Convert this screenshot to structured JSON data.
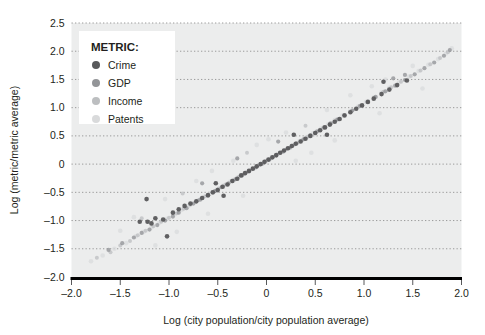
{
  "chart_data": {
    "type": "scatter",
    "title": "",
    "xlabel": "Log (city population/city population average)",
    "ylabel": "Log (metric/metric average)",
    "xlim": [
      -2.0,
      2.0
    ],
    "ylim": [
      -2.0,
      2.5
    ],
    "xticks": [
      "-2.0",
      "-1.5",
      "-1.0",
      "-0.5",
      "0",
      "0.5",
      "1.0",
      "1.5",
      "2.0"
    ],
    "xtick_values": [
      -2.0,
      -1.5,
      -1.0,
      -0.5,
      0,
      0.5,
      1.0,
      1.5,
      2.0
    ],
    "yticks": [
      "2.5",
      "2.0",
      "1.5",
      "1.0",
      "0.5",
      "0",
      "-0.5",
      "-1.0",
      "-1.5",
      "-2.0"
    ],
    "ytick_values": [
      2.5,
      2.0,
      1.5,
      1.0,
      0.5,
      0,
      -0.5,
      -1.0,
      -1.5,
      -2.0
    ],
    "grid": true,
    "grid_style": "dotted-horizontal",
    "legend_position": "top-left",
    "legend_title": "METRIC:",
    "panel_background": "#eceded",
    "series": [
      {
        "name": "Crime",
        "color": "#58595b",
        "marker_size": 4.6,
        "opacity": 0.95,
        "points": [
          [
            -1.3,
            -1.02
          ],
          [
            -1.23,
            -0.62
          ],
          [
            -1.14,
            -0.96
          ],
          [
            -1.06,
            -0.98
          ],
          [
            -1.02,
            -1.28
          ],
          [
            -0.96,
            -0.86
          ],
          [
            -0.9,
            -0.8
          ],
          [
            -0.84,
            -0.74
          ],
          [
            -0.78,
            -0.7
          ],
          [
            -0.72,
            -0.66
          ],
          [
            -0.66,
            -0.6
          ],
          [
            -0.6,
            -0.55
          ],
          [
            -0.55,
            -0.5
          ],
          [
            -0.5,
            -0.46
          ],
          [
            -0.45,
            -0.4
          ],
          [
            -0.4,
            -0.36
          ],
          [
            -0.35,
            -0.3
          ],
          [
            -0.3,
            -0.26
          ],
          [
            -0.26,
            -0.2
          ],
          [
            -0.22,
            -0.16
          ],
          [
            -0.18,
            -0.12
          ],
          [
            -0.14,
            -0.08
          ],
          [
            -0.1,
            -0.04
          ],
          [
            -0.06,
            0.0
          ],
          [
            -0.02,
            0.04
          ],
          [
            0.02,
            0.08
          ],
          [
            0.06,
            0.12
          ],
          [
            0.1,
            0.16
          ],
          [
            0.14,
            0.2
          ],
          [
            0.18,
            0.24
          ],
          [
            0.22,
            0.28
          ],
          [
            0.26,
            0.32
          ],
          [
            0.3,
            0.36
          ],
          [
            0.35,
            0.4
          ],
          [
            0.4,
            0.45
          ],
          [
            0.45,
            0.5
          ],
          [
            0.5,
            0.55
          ],
          [
            0.55,
            0.6
          ],
          [
            0.6,
            0.65
          ],
          [
            0.65,
            0.7
          ],
          [
            0.7,
            0.75
          ],
          [
            0.75,
            0.8
          ],
          [
            0.8,
            0.86
          ],
          [
            0.86,
            0.92
          ],
          [
            0.92,
            0.98
          ],
          [
            0.98,
            1.04
          ],
          [
            1.04,
            1.1
          ],
          [
            1.1,
            1.16
          ],
          [
            1.18,
            1.24
          ],
          [
            1.26,
            1.32
          ],
          [
            1.34,
            1.4
          ],
          [
            1.44,
            1.48
          ],
          [
            1.2,
            1.46
          ],
          [
            0.28,
            0.52
          ],
          [
            -0.44,
            -0.56
          ],
          [
            -0.52,
            -0.34
          ],
          [
            0.62,
            0.52
          ],
          [
            -1.22,
            -1.02
          ],
          [
            -1.18,
            -1.05
          ]
        ]
      },
      {
        "name": "GDP",
        "color": "#939598",
        "marker_size": 4.2,
        "opacity": 0.8,
        "points": [
          [
            -1.62,
            -1.52
          ],
          [
            -1.48,
            -1.4
          ],
          [
            -1.36,
            -1.3
          ],
          [
            -1.28,
            -1.22
          ],
          [
            -1.2,
            -1.16
          ],
          [
            -1.12,
            -1.08
          ],
          [
            -1.04,
            -1.0
          ],
          [
            -0.96,
            -0.93
          ],
          [
            -0.9,
            -0.86
          ],
          [
            -0.82,
            -0.78
          ],
          [
            -0.75,
            -0.7
          ],
          [
            -0.68,
            -0.63
          ],
          [
            -0.6,
            -0.56
          ],
          [
            -0.53,
            -0.48
          ],
          [
            -0.46,
            -0.41
          ],
          [
            -0.39,
            -0.34
          ],
          [
            -0.32,
            -0.27
          ],
          [
            -0.25,
            -0.2
          ],
          [
            -0.18,
            -0.13
          ],
          [
            -0.11,
            -0.06
          ],
          [
            -0.04,
            0.01
          ],
          [
            0.03,
            0.08
          ],
          [
            0.1,
            0.15
          ],
          [
            0.17,
            0.22
          ],
          [
            0.24,
            0.29
          ],
          [
            0.31,
            0.37
          ],
          [
            0.38,
            0.44
          ],
          [
            0.45,
            0.51
          ],
          [
            0.52,
            0.58
          ],
          [
            0.59,
            0.65
          ],
          [
            0.66,
            0.72
          ],
          [
            0.73,
            0.79
          ],
          [
            0.8,
            0.87
          ],
          [
            0.88,
            0.95
          ],
          [
            0.96,
            1.03
          ],
          [
            1.04,
            1.11
          ],
          [
            1.12,
            1.19
          ],
          [
            1.22,
            1.29
          ],
          [
            1.32,
            1.39
          ],
          [
            1.42,
            1.49
          ],
          [
            1.52,
            1.59
          ],
          [
            1.62,
            1.7
          ],
          [
            1.72,
            1.8
          ],
          [
            1.82,
            1.92
          ],
          [
            1.88,
            2.02
          ],
          [
            -0.3,
            0.1
          ],
          [
            0.12,
            0.4
          ],
          [
            -0.66,
            -0.34
          ],
          [
            1.3,
            1.52
          ],
          [
            1.42,
            1.58
          ]
        ]
      },
      {
        "name": "Income",
        "color": "#bcbec0",
        "marker_size": 4.0,
        "opacity": 0.75,
        "points": [
          [
            -1.74,
            -1.66
          ],
          [
            -1.6,
            -1.56
          ],
          [
            -1.5,
            -1.44
          ],
          [
            -1.4,
            -1.36
          ],
          [
            -1.32,
            -1.26
          ],
          [
            -1.24,
            -1.18
          ],
          [
            -1.16,
            -1.1
          ],
          [
            -1.08,
            -1.02
          ],
          [
            -1.0,
            -0.95
          ],
          [
            -0.92,
            -0.87
          ],
          [
            -0.85,
            -0.79
          ],
          [
            -0.78,
            -0.72
          ],
          [
            -0.7,
            -0.64
          ],
          [
            -0.63,
            -0.57
          ],
          [
            -0.56,
            -0.5
          ],
          [
            -0.49,
            -0.43
          ],
          [
            -0.42,
            -0.36
          ],
          [
            -0.35,
            -0.29
          ],
          [
            -0.28,
            -0.22
          ],
          [
            -0.21,
            -0.15
          ],
          [
            -0.14,
            -0.08
          ],
          [
            -0.07,
            -0.01
          ],
          [
            0.0,
            0.06
          ],
          [
            0.07,
            0.13
          ],
          [
            0.14,
            0.2
          ],
          [
            0.21,
            0.27
          ],
          [
            0.28,
            0.34
          ],
          [
            0.36,
            0.42
          ],
          [
            0.43,
            0.49
          ],
          [
            0.5,
            0.56
          ],
          [
            0.58,
            0.64
          ],
          [
            0.65,
            0.72
          ],
          [
            0.72,
            0.79
          ],
          [
            0.8,
            0.87
          ],
          [
            0.88,
            0.95
          ],
          [
            0.95,
            1.02
          ],
          [
            1.03,
            1.1
          ],
          [
            1.11,
            1.18
          ],
          [
            1.2,
            1.28
          ],
          [
            1.28,
            1.36
          ],
          [
            1.38,
            1.46
          ],
          [
            1.48,
            1.56
          ],
          [
            1.58,
            1.66
          ],
          [
            1.68,
            1.77
          ],
          [
            1.78,
            1.88
          ],
          [
            1.86,
            1.98
          ],
          [
            -0.2,
            0.2
          ],
          [
            0.4,
            0.68
          ],
          [
            -0.86,
            -0.52
          ],
          [
            -1.28,
            -0.96
          ]
        ]
      },
      {
        "name": "Patents",
        "color": "#d9dadb",
        "marker_size": 4.6,
        "opacity": 0.7,
        "points": [
          [
            -1.8,
            -1.72
          ],
          [
            -1.68,
            -1.62
          ],
          [
            -1.56,
            -1.5
          ],
          [
            -1.44,
            -1.4
          ],
          [
            -1.34,
            -1.28
          ],
          [
            -1.26,
            -1.2
          ],
          [
            -1.18,
            -1.12
          ],
          [
            -1.1,
            -1.04
          ],
          [
            -1.02,
            -0.97
          ],
          [
            -0.94,
            -0.89
          ],
          [
            -0.87,
            -0.81
          ],
          [
            -0.8,
            -0.74
          ],
          [
            -0.73,
            -0.67
          ],
          [
            -0.65,
            -0.59
          ],
          [
            -0.58,
            -0.52
          ],
          [
            -0.51,
            -0.45
          ],
          [
            -0.44,
            -0.38
          ],
          [
            -0.37,
            -0.31
          ],
          [
            -0.3,
            -0.24
          ],
          [
            -0.23,
            -0.17
          ],
          [
            -0.16,
            -0.1
          ],
          [
            -0.09,
            -0.03
          ],
          [
            -0.02,
            0.04
          ],
          [
            0.05,
            0.11
          ],
          [
            0.12,
            0.18
          ],
          [
            0.19,
            0.25
          ],
          [
            0.26,
            0.33
          ],
          [
            0.34,
            0.41
          ],
          [
            0.41,
            0.48
          ],
          [
            0.48,
            0.55
          ],
          [
            0.56,
            0.63
          ],
          [
            0.63,
            0.7
          ],
          [
            0.7,
            0.78
          ],
          [
            0.78,
            0.86
          ],
          [
            0.86,
            0.94
          ],
          [
            0.94,
            1.02
          ],
          [
            1.02,
            1.1
          ],
          [
            1.1,
            1.18
          ],
          [
            1.18,
            1.27
          ],
          [
            1.26,
            1.35
          ],
          [
            1.36,
            1.45
          ],
          [
            1.46,
            1.55
          ],
          [
            1.56,
            1.65
          ],
          [
            1.66,
            1.76
          ],
          [
            1.76,
            1.86
          ],
          [
            1.84,
            1.96
          ],
          [
            1.9,
            2.05
          ],
          [
            -0.56,
            -0.12
          ],
          [
            0.2,
            0.56
          ],
          [
            0.86,
            1.22
          ],
          [
            -1.04,
            -0.62
          ],
          [
            -1.36,
            -0.94
          ],
          [
            -0.1,
            0.34
          ],
          [
            0.62,
            0.96
          ],
          [
            1.22,
            1.5
          ],
          [
            -0.34,
            0.06
          ],
          [
            0.02,
            0.44
          ],
          [
            -0.72,
            -0.3
          ],
          [
            1.08,
            1.38
          ],
          [
            1.5,
            1.74
          ],
          [
            -1.5,
            -1.18
          ],
          [
            -0.24,
            -0.56
          ],
          [
            0.3,
            0.06
          ],
          [
            -0.6,
            -0.88
          ],
          [
            0.7,
            0.42
          ],
          [
            -1.14,
            -1.44
          ],
          [
            1.16,
            0.9
          ],
          [
            0.46,
            0.2
          ],
          [
            -0.92,
            -1.2
          ],
          [
            1.6,
            1.34
          ]
        ]
      }
    ]
  },
  "legend": {
    "title": "METRIC:",
    "items": [
      {
        "label": "Crime",
        "color": "#58595b"
      },
      {
        "label": "GDP",
        "color": "#939598"
      },
      {
        "label": "Income",
        "color": "#bcbec0"
      },
      {
        "label": "Patents",
        "color": "#d9dadb"
      }
    ]
  },
  "axes": {
    "x_title": "Log (city population/city population average)",
    "y_title": "Log (metric/metric average)"
  }
}
